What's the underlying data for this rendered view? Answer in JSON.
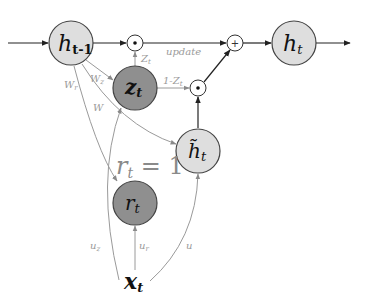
{
  "diagram": {
    "nodes": {
      "h_prev": {
        "main": "h",
        "sub": "t-1",
        "fill": "#dedede"
      },
      "z": {
        "main": "z",
        "sub": "t",
        "fill": "#8f8f8f"
      },
      "h_tilde": {
        "main": "h̃",
        "sub": "t",
        "fill": "#dedede"
      },
      "r": {
        "main": "r",
        "sub": "t",
        "fill": "#8f8f8f"
      },
      "h_t": {
        "main": "h",
        "sub": "t",
        "fill": "#dedede"
      },
      "x": {
        "main": "x",
        "sub": "t"
      }
    },
    "operators": {
      "mult_top": "⊙",
      "mult_low": "⊙",
      "add": "+"
    },
    "edge_labels": {
      "z_top": "Z",
      "z_top_sub": "t",
      "update": "update",
      "one_minus_z": "1-Z",
      "one_minus_z_sub": "t",
      "W_z": "W",
      "W_z_sub": "z",
      "W_r": "W",
      "W_r_sub": "r",
      "W": "W",
      "u_z": "u",
      "u_z_sub": "z",
      "u_r": "u",
      "u_r_sub": "r",
      "u": "u"
    },
    "annotation": {
      "main": "r",
      "sub": "t",
      "rest": " = 1"
    },
    "colors": {
      "dark_node": "#8f8f8f",
      "light_node": "#dedede",
      "stroke": "#333333",
      "gray_edge": "#9a9a9a",
      "label": "#9a9a9a"
    }
  }
}
